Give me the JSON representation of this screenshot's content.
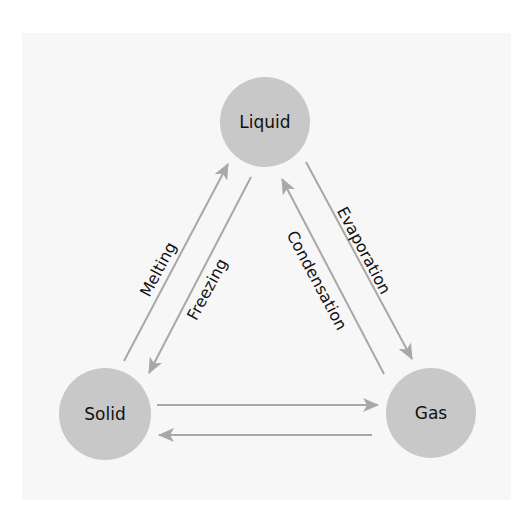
{
  "diagram": {
    "colors": {
      "background": "#f7f7f7",
      "node_fill": "#c8c8c8",
      "arrow": "#a8a8a8",
      "text": "#111111"
    },
    "nodes": [
      {
        "id": "liquid",
        "label": "Liquid",
        "cx": 265,
        "cy": 122,
        "r": 45
      },
      {
        "id": "solid",
        "label": "Solid",
        "cx": 105,
        "cy": 414,
        "r": 46
      },
      {
        "id": "gas",
        "label": "Gas",
        "cx": 431,
        "cy": 413,
        "r": 45
      }
    ],
    "edges": [
      {
        "id": "melting",
        "from": "solid",
        "to": "liquid",
        "label": "Melting"
      },
      {
        "id": "freezing",
        "from": "liquid",
        "to": "solid",
        "label": "Freezing"
      },
      {
        "id": "evaporation",
        "from": "liquid",
        "to": "gas",
        "label": "Evaporation"
      },
      {
        "id": "condensation",
        "from": "gas",
        "to": "liquid",
        "label": "Condensation"
      },
      {
        "id": "solid-to-gas",
        "from": "solid",
        "to": "gas",
        "label": ""
      },
      {
        "id": "gas-to-solid",
        "from": "gas",
        "to": "solid",
        "label": ""
      }
    ]
  }
}
